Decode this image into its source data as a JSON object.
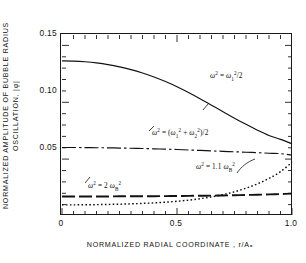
{
  "axes": {
    "ylabel_line1": "NORMALIZED AMPLITUDE OF BUBBLE RADIUS",
    "ylabel_line2": "OSCILLATION,  |φ|",
    "xlabel": "NORMALIZED   RADIAL   COORDINATE ,  r/Aₐ",
    "yticks": [
      "0.15",
      "0.10",
      "0.05"
    ],
    "ytick_values": [
      0.15,
      0.1,
      0.05
    ],
    "xticks": [
      "0",
      "0.5",
      "1.0"
    ],
    "xtick_values": [
      0,
      0.5,
      1.0
    ]
  },
  "annotations": {
    "curve1": {
      "omega": "ω",
      "sup1": "2",
      "eq": " = ",
      "omega2": "ω",
      "sub2": "1",
      "sup2": "2",
      "tail": "/2"
    },
    "curve2": {
      "omega": "ω",
      "sup1": "2",
      "eq": " =  (",
      "omegaA": "ω",
      "subA": "1",
      "supA": "2",
      "plus": " + ",
      "omegaB": "ω",
      "subB": "2",
      "supB": "2",
      "tail": ")/2"
    },
    "curve3": {
      "omega": "ω",
      "sup1": "2",
      "eq": " = 1.1 ",
      "omegaB": "ω",
      "subB": "B",
      "supB": "2"
    },
    "curve4": {
      "omega": "ω",
      "sup1": "2",
      "eq": " = 2 ",
      "omegaB": "ω",
      "subB": "B",
      "supB": "2"
    }
  },
  "chart_data": {
    "type": "line",
    "title": "",
    "xlabel": "NORMALIZED RADIAL COORDINATE, r/Aₐ",
    "ylabel": "NORMALIZED AMPLITUDE OF BUBBLE RADIUS OSCILLATION, |φ|",
    "xlim": [
      0,
      1.0
    ],
    "ylim": [
      0,
      0.16
    ],
    "grid": false,
    "legend": "inline-annotations",
    "x": [
      0.0,
      0.05,
      0.1,
      0.15,
      0.2,
      0.25,
      0.3,
      0.35,
      0.4,
      0.45,
      0.5,
      0.55,
      0.6,
      0.65,
      0.7,
      0.75,
      0.8,
      0.85,
      0.9,
      0.95,
      1.0
    ],
    "series": [
      {
        "name": "ω² = ω₁²/2",
        "style": "solid",
        "values": [
          0.137,
          0.1368,
          0.1362,
          0.1352,
          0.1337,
          0.1317,
          0.1292,
          0.1262,
          0.1227,
          0.1186,
          0.114,
          0.1089,
          0.1034,
          0.0976,
          0.0918,
          0.0861,
          0.0806,
          0.0754,
          0.0707,
          0.0672,
          0.0633
        ]
      },
      {
        "name": "ω² = (ω₁² + ω₂²)/2",
        "style": "dash-dot",
        "values": [
          0.06,
          0.06,
          0.0599,
          0.0598,
          0.0597,
          0.0595,
          0.0593,
          0.0591,
          0.0588,
          0.0585,
          0.0582,
          0.0578,
          0.0574,
          0.057,
          0.0566,
          0.0562,
          0.0558,
          0.0554,
          0.0549,
          0.0545,
          0.0532
        ]
      },
      {
        "name": "ω² = 2 ωʙ²",
        "style": "dashed",
        "values": [
          0.0165,
          0.0165,
          0.0165,
          0.0165,
          0.0165,
          0.0166,
          0.0166,
          0.0167,
          0.0167,
          0.0168,
          0.0169,
          0.017,
          0.0171,
          0.0172,
          0.0174,
          0.0176,
          0.0178,
          0.018,
          0.0183,
          0.0186,
          0.019
        ]
      },
      {
        "name": "ω² = 1.1 ωʙ²",
        "style": "dotted",
        "values": [
          0.009,
          0.009,
          0.0091,
          0.0092,
          0.0094,
          0.0096,
          0.0099,
          0.0103,
          0.0108,
          0.0114,
          0.0122,
          0.0132,
          0.0145,
          0.0161,
          0.0181,
          0.0206,
          0.0238,
          0.0277,
          0.0325,
          0.0385,
          0.0468
        ]
      }
    ]
  }
}
